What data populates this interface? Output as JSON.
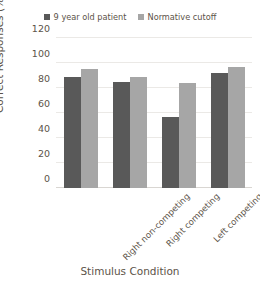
{
  "chart_data": {
    "type": "bar",
    "title": "",
    "categories": [
      "Right non-competing",
      "Right competing",
      "Left competing",
      "Left non-competing"
    ],
    "series": [
      {
        "name": "9 year old patient",
        "color": "#595959",
        "values": [
          89,
          85,
          57,
          92
        ]
      },
      {
        "name": "Normative cutoff",
        "color": "#a6a6a6",
        "values": [
          95,
          89,
          84,
          97
        ]
      }
    ],
    "xlabel": "Stimulus Condition",
    "ylabel": "Correct Responses (%)",
    "ylim": [
      0,
      120
    ],
    "yticks": [
      0,
      20,
      40,
      60,
      80,
      100,
      120
    ],
    "ytick_labels": [
      "0",
      "20",
      "40",
      "60",
      "80",
      "100",
      "120"
    ],
    "grid": true,
    "legend_position": "top"
  },
  "legend": {
    "entries": [
      {
        "label": "9 year old patient",
        "swatch": "legend-swatch-dark"
      },
      {
        "label": "Normative cutoff",
        "swatch": "legend-swatch-light"
      }
    ]
  },
  "axes": {
    "x_title": "Stimulus Condition",
    "y_title": "Correct Responses (%)"
  }
}
